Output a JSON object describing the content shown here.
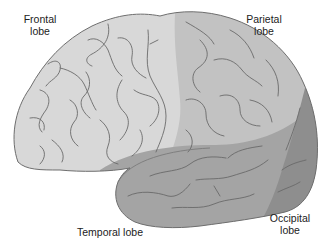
{
  "diagram": {
    "labels": {
      "frontal": [
        "Frontal",
        "lobe"
      ],
      "parietal": [
        "Parietal",
        "lobe"
      ],
      "temporal": [
        "Temporal lobe"
      ],
      "occipital": [
        "Occipital",
        "lobe"
      ]
    },
    "colors": {
      "frontal": "#d8d8d8",
      "parietal": "#c2c2c2",
      "temporal": "#a4a4a4",
      "occipital": "#8e8e8e",
      "outline": "#6e6e6e",
      "sulci": "#6a6a6a"
    }
  }
}
